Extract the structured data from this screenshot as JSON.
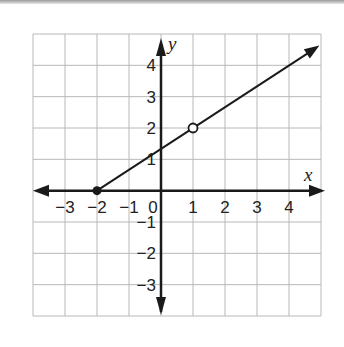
{
  "chart_data": {
    "type": "line",
    "title": "",
    "xlabel": "x",
    "ylabel": "y",
    "xlim": [
      -4,
      5
    ],
    "ylim": [
      -4,
      5
    ],
    "grid": true,
    "x_ticks": [
      -3,
      -2,
      -1,
      0,
      1,
      2,
      3,
      4
    ],
    "x_tick_labels": [
      "−3",
      "−2",
      "−1",
      "0",
      "1",
      "2",
      "3",
      "4"
    ],
    "y_ticks": [
      4,
      3,
      2,
      1,
      -1,
      -2,
      -3
    ],
    "y_tick_labels": [
      "4",
      "3",
      "2",
      "1",
      "−1",
      "−2",
      "−3"
    ],
    "series": [
      {
        "name": "ray",
        "kind": "ray",
        "start": [
          -2,
          0
        ],
        "through": [
          1,
          2
        ],
        "end": [
          4.95,
          4.63
        ],
        "slope": 0.6667,
        "start_endpoint": "closed",
        "arrow_at_end": true
      }
    ],
    "points": [
      {
        "x": -2,
        "y": 0,
        "style": "closed"
      },
      {
        "x": 1,
        "y": 2,
        "style": "open"
      }
    ]
  },
  "colors": {
    "grid": "#b8b8b8",
    "axis": "#1a1a1a",
    "line": "#1a1a1a"
  }
}
